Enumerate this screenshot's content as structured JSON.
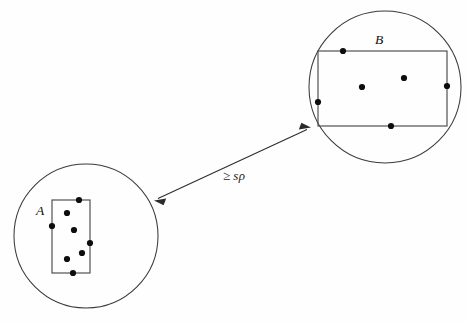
{
  "figure": {
    "canvas": {
      "width": 467,
      "height": 323,
      "background": "#fefefe"
    },
    "type": "point-set-separation-diagram",
    "colors": {
      "circle_stroke": "#3a3a3a",
      "box_stroke": "#4a4a4a",
      "dot_fill": "#0d0d0d",
      "arrow_stroke": "#2b2b2b",
      "label_fill": "#101010"
    },
    "clusters": [
      {
        "id": "A",
        "label": "A",
        "label_position": {
          "x": 40,
          "y": 212
        },
        "circle": {
          "cx": 86,
          "cy": 236,
          "r": 72
        },
        "box": {
          "x": 52,
          "y": 200,
          "width": 38,
          "height": 73
        },
        "points": [
          {
            "x": 79,
            "y": 200
          },
          {
            "x": 67,
            "y": 213
          },
          {
            "x": 52,
            "y": 226
          },
          {
            "x": 74,
            "y": 230
          },
          {
            "x": 90,
            "y": 243
          },
          {
            "x": 82,
            "y": 253
          },
          {
            "x": 67,
            "y": 259
          },
          {
            "x": 73,
            "y": 273
          }
        ],
        "point_count": 8
      },
      {
        "id": "B",
        "label": "B",
        "label_position": {
          "x": 379,
          "y": 41
        },
        "circle": {
          "cx": 385,
          "cy": 87,
          "r": 76
        },
        "box": {
          "x": 318,
          "y": 51,
          "width": 129,
          "height": 75
        },
        "points": [
          {
            "x": 343,
            "y": 51
          },
          {
            "x": 362,
            "y": 87
          },
          {
            "x": 404,
            "y": 78
          },
          {
            "x": 447,
            "y": 86
          },
          {
            "x": 318,
            "y": 102
          },
          {
            "x": 391,
            "y": 126
          }
        ],
        "point_count": 6
      }
    ],
    "separation": {
      "arrow": {
        "from": {
          "x": 155,
          "y": 200
        },
        "to": {
          "x": 310,
          "y": 128
        },
        "double_headed": true
      },
      "label": {
        "relation": "≥",
        "variable": "s",
        "parameter": "ρ",
        "full_text": "≥ sρ",
        "position": {
          "x": 223,
          "y": 180
        }
      }
    }
  }
}
